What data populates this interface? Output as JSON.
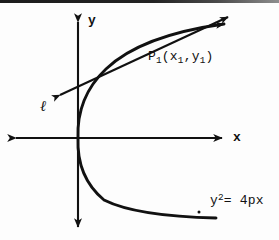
{
  "figure": {
    "background_color": "#fdfdfd",
    "ink_color": "#111111",
    "width": 279,
    "height": 240
  },
  "axes": {
    "origin": {
      "x": 78,
      "y": 138
    },
    "x_axis": {
      "label": "x",
      "left_end": {
        "x": 10,
        "y": 138
      },
      "right_end": {
        "x": 228,
        "y": 138
      },
      "arrow_left": true,
      "arrow_right": true
    },
    "y_axis": {
      "label": "y",
      "top_end": {
        "x": 78,
        "y": 16
      },
      "bottom_end": {
        "x": 78,
        "y": 233
      },
      "arrow_top": true,
      "arrow_bottom": true
    }
  },
  "curve": {
    "name": "parabola",
    "equation_label": "y",
    "equation_exponent": "2",
    "equation_rest": "= 4px",
    "equation_plain": "y2 = 4px",
    "opens": "right",
    "vertex": {
      "x": 78,
      "y": 138
    },
    "upper_end": {
      "x": 232,
      "y": 28
    },
    "lower_end": {
      "x": 216,
      "y": 218
    },
    "arrow_upper": true,
    "arrow_lower": false,
    "end_dot": {
      "x": 199,
      "y": 212
    }
  },
  "tangent": {
    "name": "tangent-line",
    "label": "ℓ",
    "arrow_start": {
      "x": 55,
      "y": 97
    },
    "arrow_end": {
      "x": 234,
      "y": 14
    },
    "arrow_left": true,
    "arrow_right": true
  },
  "point": {
    "name": "P1",
    "base": "P",
    "base_sub": "1",
    "open_paren": "(",
    "coord_x": "x",
    "coord_x_sub": "1",
    "comma": ",",
    "coord_y": "y",
    "coord_y_sub": "1",
    "close_paren": ")",
    "plain": "P1(x1,y1)",
    "tangency": {
      "x": 152,
      "y": 47
    }
  },
  "scan_artifact": {
    "present": true,
    "edge": "top"
  }
}
